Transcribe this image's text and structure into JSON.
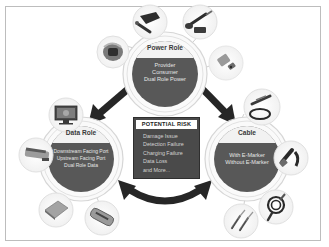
{
  "diagram": {
    "center_box": {
      "title": "POTENTIAL RISK",
      "items": [
        "Damage Issue",
        "Detection Failure",
        "Charging Failure",
        "Data Loss",
        "and More..."
      ]
    },
    "nodes": [
      {
        "id": "power",
        "title": "Power Role",
        "lines": [
          "Provider",
          "Consumer",
          "Dual Role Power"
        ],
        "satellites": [
          "wall-charger-icon",
          "car-charger-icon",
          "usb-cable-icon",
          "power-adapter-icon",
          "power-bank-icon"
        ]
      },
      {
        "id": "data",
        "title": "Data Role",
        "lines": [
          "Downstream Facing Port",
          "Upstream Facing Port",
          "Dual Role Data"
        ],
        "satellites": [
          "monitor-icon",
          "docking-station-icon",
          "laptop-icon",
          "usb-hub-icon"
        ]
      },
      {
        "id": "cable",
        "title": "Cable",
        "lines": [
          "With E-Marker",
          "Without E-Marker"
        ],
        "satellites": [
          "coiled-cable-icon",
          "usb-c-connector-icon",
          "cable-reel-icon",
          "usb-c-plugs-icon"
        ]
      }
    ],
    "arrows": [
      "power-data-bidirectional",
      "power-cable-bidirectional",
      "data-cable-bidirectional"
    ],
    "colors": {
      "circle_fill": "#585858",
      "circle_band": "#f2f2f2",
      "ring": "#d4d4d4",
      "arrow": "#262626",
      "risk_box": "#4a4a4a",
      "frame": "#bdbdbd"
    }
  }
}
